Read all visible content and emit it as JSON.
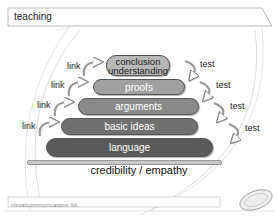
{
  "title": "teaching",
  "pyramid": {
    "layers": [
      {
        "label_line1": "conclusion",
        "label_line2": "understanding",
        "color": "#b8b8b8"
      },
      {
        "label": "proofs",
        "color": "#a0a0a0"
      },
      {
        "label": "arguments",
        "color": "#8a8a8a"
      },
      {
        "label": "basic ideas",
        "color": "#707070"
      },
      {
        "label": "language",
        "color": "#5a5a5a"
      }
    ],
    "left_labels": [
      "link",
      "link",
      "link",
      "link"
    ],
    "right_labels": [
      "test",
      "test",
      "test",
      "test"
    ],
    "foundation": "credibility / empathy"
  },
  "footer": {
    "company": "visualcommunications ltd",
    "logo_text": "VC2"
  }
}
